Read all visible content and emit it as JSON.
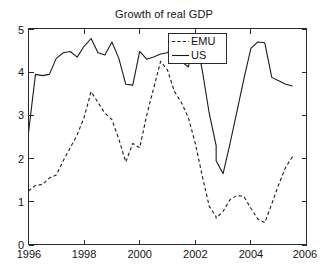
{
  "chart_data": {
    "type": "line",
    "title": "Growth of real GDP",
    "xlabel": "",
    "ylabel": "",
    "xlim": [
      1996,
      2006
    ],
    "ylim": [
      0,
      5
    ],
    "xticks": [
      1996,
      1998,
      2000,
      2002,
      2004,
      2006
    ],
    "yticks": [
      0,
      1,
      2,
      3,
      4,
      5
    ],
    "xtick_labels": [
      "1996",
      "1998",
      "2000",
      "2002",
      "2004",
      "2006"
    ],
    "ytick_labels": [
      "0",
      "1",
      "2",
      "3",
      "4",
      "5"
    ],
    "grid": false,
    "legend_position": "top-center-right",
    "x": [
      1996.0,
      1996.25,
      1996.5,
      1996.75,
      1997.0,
      1997.25,
      1997.5,
      1997.75,
      1998.0,
      1998.25,
      1998.5,
      1998.75,
      1999.0,
      1999.25,
      1999.5,
      1999.75,
      2000.0,
      2000.25,
      2000.5,
      2000.75,
      2001.0,
      2001.25,
      2001.5,
      2001.75,
      2002.0,
      2002.25,
      2002.5,
      2002.75,
      2003.0,
      2003.25,
      2003.5,
      2003.75,
      2004.0,
      2004.25,
      2004.5,
      2004.75,
      2005.0,
      2005.25,
      2005.5
    ],
    "series": [
      {
        "name": "EMU",
        "style": "dashed",
        "color": "#1b1b1b",
        "values": [
          1.25,
          1.38,
          1.4,
          1.55,
          1.62,
          1.95,
          2.25,
          2.55,
          2.95,
          3.55,
          3.3,
          3.05,
          2.9,
          2.45,
          1.92,
          2.35,
          2.25,
          3.0,
          3.62,
          4.25,
          4.05,
          3.55,
          3.3,
          2.95,
          2.35,
          1.6,
          0.9,
          0.65,
          0.85,
          1.05,
          1.12,
          1.05,
          0.72,
          0.52,
          0.58,
          1.05,
          1.5,
          1.95,
          2.02
        ]
      },
      {
        "name": "US",
        "style": "solid",
        "color": "#1b1b1b",
        "values": [
          2.6,
          3.95,
          3.92,
          3.95,
          4.32,
          4.45,
          4.48,
          4.35,
          4.6,
          4.78,
          4.45,
          4.4,
          4.7,
          4.32,
          3.72,
          3.7,
          4.48,
          4.3,
          4.35,
          4.42,
          4.45,
          4.72,
          4.25,
          4.12,
          4.85,
          4.05,
          3.05,
          2.3,
          2.1,
          1.9,
          1.42,
          0.63,
          0.5,
          0.38,
          0.25,
          0.6,
          1.3,
          1.32,
          2.25
        ]
      }
    ],
    "series_tail": {
      "note": "continuation points beyond index 38",
      "x": [
        2002.75,
        2003.0,
        2003.25,
        2003.5,
        2003.75,
        2004.0,
        2004.25,
        2004.5,
        2004.75,
        2005.0,
        2005.25,
        2005.5
      ],
      "EMU": [
        0.62,
        0.78,
        1.05,
        1.15,
        1.12,
        0.85,
        0.6,
        0.52,
        0.95,
        1.4,
        1.8,
        2.05
      ],
      "US": [
        1.95,
        1.65,
        2.35,
        3.1,
        3.85,
        4.55,
        4.7,
        4.68,
        3.88,
        3.8,
        3.72,
        3.68
      ]
    }
  },
  "legend": {
    "entries": [
      {
        "label": "EMU",
        "style": "dashed"
      },
      {
        "label": "US",
        "style": "solid"
      }
    ]
  },
  "title": "Growth of real GDP"
}
